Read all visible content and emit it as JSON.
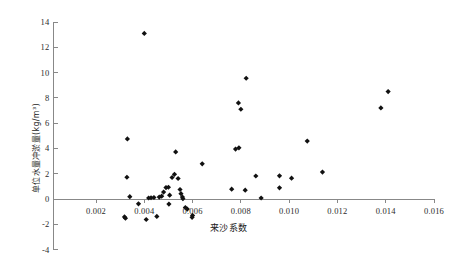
{
  "chart_data": {
    "type": "scatter",
    "title": "",
    "xlabel": "来沙系数",
    "ylabel": "单位水量冲淤量(kg/m³)",
    "xlim": [
      0.0,
      0.0168
    ],
    "ylim": [
      -4,
      14
    ],
    "xticks": [
      0.002,
      0.004,
      0.006,
      0.008,
      0.01,
      0.012,
      0.014,
      0.016
    ],
    "xtick_labels": [
      "0.002",
      "0.004",
      "0.006",
      "0.008",
      "0.010",
      "0.012",
      "0.014",
      "0.016"
    ],
    "yticks": [
      -4,
      -2,
      0,
      2,
      4,
      6,
      8,
      10,
      12,
      14
    ],
    "ytick_labels": [
      "-4",
      "-2",
      "0",
      "2",
      "4",
      "6",
      "8",
      "10",
      "12",
      "14"
    ],
    "grid": false,
    "legend": null,
    "marker": "diamond",
    "marker_color": "#111111",
    "axis_color": "#888888",
    "points": [
      {
        "x": 0.004,
        "y": 13.1
      },
      {
        "x": 0.00822,
        "y": 9.55
      },
      {
        "x": 0.0141,
        "y": 8.5
      },
      {
        "x": 0.0079,
        "y": 7.6
      },
      {
        "x": 0.0138,
        "y": 7.2
      },
      {
        "x": 0.008,
        "y": 7.1
      },
      {
        "x": 0.0033,
        "y": 4.75
      },
      {
        "x": 0.01075,
        "y": 4.58
      },
      {
        "x": 0.00792,
        "y": 4.05
      },
      {
        "x": 0.00778,
        "y": 3.95
      },
      {
        "x": 0.0053,
        "y": 3.72
      },
      {
        "x": 0.0064,
        "y": 2.78
      },
      {
        "x": 0.01138,
        "y": 2.13
      },
      {
        "x": 0.00525,
        "y": 1.95
      },
      {
        "x": 0.00862,
        "y": 1.82
      },
      {
        "x": 0.0096,
        "y": 1.83
      },
      {
        "x": 0.00328,
        "y": 1.72
      },
      {
        "x": 0.0101,
        "y": 1.65
      },
      {
        "x": 0.0054,
        "y": 1.62
      },
      {
        "x": 0.00515,
        "y": 1.7
      },
      {
        "x": 0.005,
        "y": 0.93
      },
      {
        "x": 0.0049,
        "y": 0.9
      },
      {
        "x": 0.0096,
        "y": 0.88
      },
      {
        "x": 0.00548,
        "y": 0.75
      },
      {
        "x": 0.00762,
        "y": 0.78
      },
      {
        "x": 0.00818,
        "y": 0.7
      },
      {
        "x": 0.0048,
        "y": 0.55
      },
      {
        "x": 0.00552,
        "y": 0.42
      },
      {
        "x": 0.00505,
        "y": 0.3
      },
      {
        "x": 0.00558,
        "y": 0.15
      },
      {
        "x": 0.0034,
        "y": 0.18
      },
      {
        "x": 0.00884,
        "y": 0.08
      },
      {
        "x": 0.00472,
        "y": 0.22
      },
      {
        "x": 0.00462,
        "y": 0.15
      },
      {
        "x": 0.0044,
        "y": 0.12
      },
      {
        "x": 0.00428,
        "y": 0.1
      },
      {
        "x": 0.00418,
        "y": 0.08
      },
      {
        "x": 0.0056,
        "y": 0.02
      },
      {
        "x": 0.00376,
        "y": -0.38
      },
      {
        "x": 0.00502,
        "y": -0.4
      },
      {
        "x": 0.0057,
        "y": -0.68
      },
      {
        "x": 0.00578,
        "y": -0.8
      },
      {
        "x": 0.006,
        "y": -1.3
      },
      {
        "x": 0.00598,
        "y": -1.45
      },
      {
        "x": 0.00318,
        "y": -1.42
      },
      {
        "x": 0.00322,
        "y": -1.52
      },
      {
        "x": 0.00452,
        "y": -1.38
      },
      {
        "x": 0.00408,
        "y": -1.62
      }
    ]
  },
  "axes": {
    "y_axis_label": "单位水量冲淤量(kg/m³)",
    "x_axis_label": "来沙系数"
  }
}
